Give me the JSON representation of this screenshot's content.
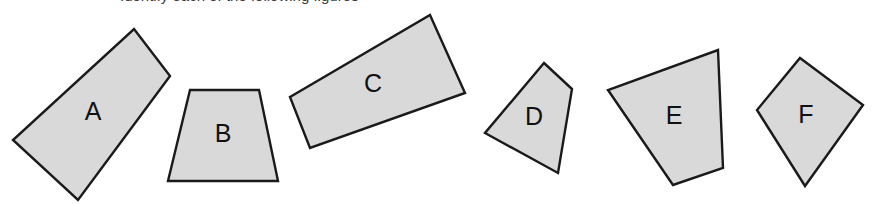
{
  "page": {
    "background_color": "#ffffff",
    "width": 887,
    "height": 205
  },
  "heading": {
    "text": "Identify each of the following figures",
    "visible_note": "cropped at top edge; only letter descenders visible"
  },
  "style": {
    "fill_color": "#d9d9d9",
    "stroke_color": "#1a1a1a",
    "stroke_width": 2.4,
    "label_color": "#111111"
  },
  "chart_data": {
    "type": "diagram",
    "title": "Identify each of the following figures",
    "shape_count": 6,
    "shapes": [
      {
        "label": "A",
        "kind": "quadrilateral",
        "points": "134,29 170,76 78,200 13,140",
        "label_x": 93,
        "label_y": 113
      },
      {
        "label": "B",
        "kind": "trapezoid",
        "points": "190,90 259,90 278,181 168,181",
        "label_x": 223,
        "label_y": 135
      },
      {
        "label": "C",
        "kind": "quadrilateral",
        "points": "430,15 465,93 310,148 290,97",
        "label_x": 373,
        "label_y": 85
      },
      {
        "label": "D",
        "kind": "quadrilateral",
        "points": "544,63 572,89 558,173 485,133",
        "label_x": 534,
        "label_y": 118
      },
      {
        "label": "E",
        "kind": "quadrilateral",
        "points": "718,50 723,168 673,185 608,90",
        "label_x": 674,
        "label_y": 117
      },
      {
        "label": "F",
        "kind": "kite",
        "points": "800,58 863,105 805,186 757,110",
        "label_x": 806,
        "label_y": 116
      }
    ]
  }
}
